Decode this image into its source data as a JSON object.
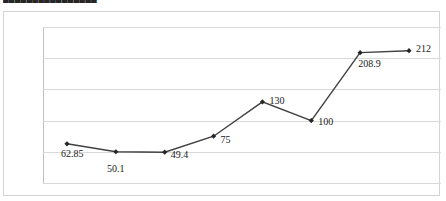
{
  "chart_title_partial": "████████████████",
  "colors": {
    "series_line": "#404040",
    "marker": "#262626",
    "gridline": "#d9d9d9",
    "frame_border": "#d4d4d4",
    "axis": "#bfbfbf",
    "tick_text": "#404040",
    "label_text": "#1a1a1a",
    "background": "#ffffff"
  },
  "chart_data": {
    "type": "line",
    "title": "",
    "xlabel": "",
    "ylabel": "",
    "categories": [
      "2009",
      "2010",
      "2011",
      "2012",
      "2013",
      "2014",
      "2015",
      "2016"
    ],
    "values": [
      62.85,
      50.1,
      49.4,
      75,
      130,
      100,
      208.9,
      212
    ],
    "point_labels": [
      "62.85",
      "50.1",
      "49.4",
      "75",
      "130",
      "100",
      "208.9",
      "212"
    ],
    "ylim": [
      0,
      250
    ],
    "yticks": [
      0,
      50,
      100,
      150,
      200,
      250
    ],
    "ytick_labels": [
      "0",
      "50",
      "100",
      "150",
      "200",
      "250"
    ],
    "grid": true,
    "legend": false,
    "markers": "diamond",
    "series": [
      {
        "name": "Series 1",
        "values": [
          62.85,
          50.1,
          49.4,
          75,
          130,
          100,
          208.9,
          212
        ]
      }
    ]
  }
}
